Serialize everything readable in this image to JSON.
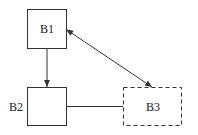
{
  "diagram": {
    "nodes": [
      {
        "id": "B1",
        "label": "B1",
        "style": "solid"
      },
      {
        "id": "B2",
        "label": "B2",
        "style": "solid"
      },
      {
        "id": "B3",
        "label": "B3",
        "style": "dashed"
      }
    ],
    "edges": [
      {
        "from": "B1",
        "to": "B2",
        "type": "arrow"
      },
      {
        "from": "B1",
        "to": "B3",
        "type": "bidirectional-arrow"
      },
      {
        "from": "B2",
        "to": "B3",
        "type": "line"
      }
    ],
    "colors": {
      "stroke": "#333333",
      "background": "#ffffff"
    }
  }
}
